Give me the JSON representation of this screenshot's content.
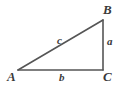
{
  "figure": {
    "kind": "right-triangle-diagram",
    "background_color": "#ffffff",
    "stroke_color": "#555555",
    "label_color": "#3a3a3a"
  },
  "vertices": {
    "a": {
      "label": "A",
      "x": 18,
      "y": 70
    },
    "b": {
      "label": "B",
      "x": 103,
      "y": 20
    },
    "c": {
      "label": "C",
      "x": 103,
      "y": 70
    }
  },
  "sides": {
    "hypotenuse": {
      "label": "c",
      "from": "A",
      "to": "B"
    },
    "vertical": {
      "label": "a",
      "from": "B",
      "to": "C"
    },
    "horizontal": {
      "label": "b",
      "from": "A",
      "to": "C"
    }
  }
}
